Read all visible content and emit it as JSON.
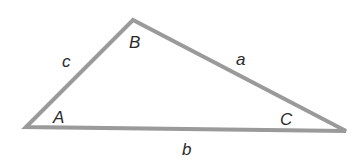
{
  "diagram": {
    "type": "triangle",
    "stroke_color": "#9a9a9a",
    "vertices": [
      {
        "id": "A",
        "label": "A",
        "x": 26,
        "y": 127,
        "label_x": 53,
        "label_y": 123
      },
      {
        "id": "B",
        "label": "B",
        "x": 133,
        "y": 20,
        "label_x": 129,
        "label_y": 48
      },
      {
        "id": "C",
        "label": "C",
        "x": 346,
        "y": 131,
        "label_x": 280,
        "label_y": 125
      }
    ],
    "sides": [
      {
        "id": "a",
        "label": "a",
        "between": "B-C",
        "label_x": 236,
        "label_y": 65
      },
      {
        "id": "b",
        "label": "b",
        "between": "A-C",
        "label_x": 182,
        "label_y": 155
      },
      {
        "id": "c",
        "label": "c",
        "between": "A-B",
        "label_x": 62,
        "label_y": 67
      }
    ]
  }
}
